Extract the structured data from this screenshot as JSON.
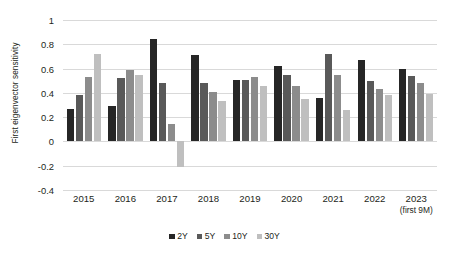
{
  "chart_data": {
    "type": "bar",
    "title": "",
    "xlabel": "",
    "ylabel": "First eigenvector sensitivity",
    "ylim": [
      -0.4,
      1
    ],
    "yticks": [
      1,
      0.8,
      0.6,
      0.4,
      0.2,
      0,
      -0.2,
      -0.4
    ],
    "ytick_labels": [
      "1",
      "0.8",
      "0.6",
      "0.4",
      "0.2",
      "0",
      "-0.2",
      "-0.4"
    ],
    "grid": true,
    "legend_position": "bottom",
    "categories": [
      "2015",
      "2016",
      "2017",
      "2018",
      "2019",
      "2020",
      "2021",
      "2022",
      "2023"
    ],
    "category_sublabels": [
      "",
      "",
      "",
      "",
      "",
      "",
      "",
      "",
      "(first 9M)"
    ],
    "series": [
      {
        "name": "2Y",
        "color": "#262626",
        "values": [
          0.27,
          0.29,
          0.84,
          0.71,
          0.51,
          0.62,
          0.36,
          0.67,
          0.6
        ]
      },
      {
        "name": "5Y",
        "color": "#595959",
        "values": [
          0.38,
          0.52,
          0.48,
          0.48,
          0.51,
          0.55,
          0.72,
          0.5,
          0.54
        ]
      },
      {
        "name": "10Y",
        "color": "#8c8c8c",
        "values": [
          0.53,
          0.59,
          0.14,
          0.41,
          0.53,
          0.46,
          0.55,
          0.43,
          0.48
        ]
      },
      {
        "name": "30Y",
        "color": "#bfbfbf",
        "values": [
          0.72,
          0.55,
          -0.21,
          0.33,
          0.46,
          0.35,
          0.26,
          0.38,
          0.39
        ]
      }
    ]
  },
  "legend": {
    "items": [
      {
        "label": "2Y",
        "color": "#262626"
      },
      {
        "label": "5Y",
        "color": "#595959"
      },
      {
        "label": "10Y",
        "color": "#8c8c8c"
      },
      {
        "label": "30Y",
        "color": "#bfbfbf"
      }
    ]
  }
}
